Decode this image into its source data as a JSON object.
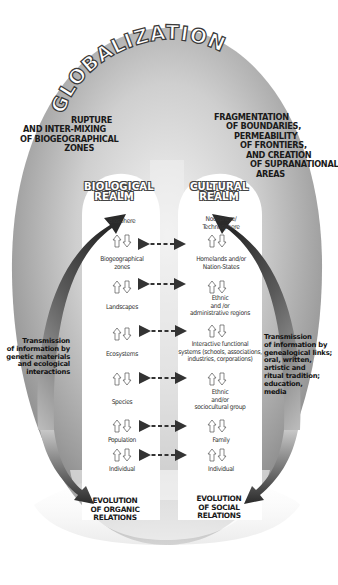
{
  "title": "GLOBALIZATION",
  "top_left_label": [
    "RUPTURE",
    "AND INTER-MIXING",
    "OF BIOGEOGRAPHICAL",
    "ZONES"
  ],
  "top_right_label": [
    "FRAGMENTATION",
    "OF BOUNDARIES,",
    "PERMEABILITY",
    "OF FRONTIERS,",
    "AND CREATION",
    "OF SUPRANATIONAL",
    "AREAS"
  ],
  "biological_realm": {
    "heading": [
      "BIOLOGICAL",
      "REALM"
    ],
    "nodes": [
      {
        "label": [
          "Biosphere"
        ]
      },
      {
        "label": [
          "Biogeographical",
          "zones"
        ]
      },
      {
        "label": [
          "Landscapes"
        ]
      },
      {
        "label": [
          "Ecosystems"
        ]
      },
      {
        "label": [
          "Species"
        ]
      },
      {
        "label": [
          "Population"
        ]
      },
      {
        "label": [
          "Individual"
        ]
      }
    ]
  },
  "cultural_realm": {
    "heading": [
      "CULTURAL",
      "REALM"
    ],
    "nodes": [
      {
        "label": [
          "Noosphere/",
          "Technosphere"
        ]
      },
      {
        "label": [
          "Homelands and/or",
          "Nation-States"
        ]
      },
      {
        "label": [
          "Ethnic",
          "and /or",
          "administrative regions"
        ]
      },
      {
        "label": [
          "Interactive functional",
          "systems (schools, associations,",
          "industries, corporations)"
        ]
      },
      {
        "label": [
          "Ethnic",
          "and/or",
          "sociocultural group"
        ]
      },
      {
        "label": [
          "Family"
        ]
      },
      {
        "label": [
          "Individual"
        ]
      }
    ]
  },
  "left_side_label": [
    "Transmission",
    "of information by",
    "genetic materials",
    "and ecological",
    "interactions"
  ],
  "right_side_label": [
    "Transmission",
    "of information by",
    "genealogical links;",
    "oral, written,",
    "artistic and",
    "ritual tradition;",
    "education,",
    "media"
  ],
  "bottom_left_label": [
    "EVOLUTION",
    "OF ORGANIC",
    "RELATIONS"
  ],
  "bottom_right_label": [
    "EVOLUTION",
    "OF SOCIAL",
    "RELATIONS"
  ],
  "icons": {
    "hierarchy_arrows": "up-down-outline-arrows",
    "correspondence_arrows": "dashed-double-headed-arrow",
    "cycle_arrows": "curved-dark-arrow"
  },
  "colors": {
    "egg_outer": "#8a8a8a",
    "egg_mid": "#bdbdbd",
    "realm_fill": "#ffffff",
    "arrow_dark": "#2e2e2e",
    "dashed_arrow": "#333333"
  }
}
